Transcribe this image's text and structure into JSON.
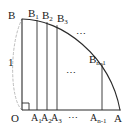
{
  "figure": {
    "kind": "quarter-circle-riemann-sum-diagram",
    "stroke_color": "#2b2b2b",
    "light_stroke_color": "#b9b9b9",
    "background_color": "#ffffff",
    "radius_label": "1",
    "axes": {
      "origin_label": "O",
      "x_end_label": "A",
      "y_end_label": "B"
    },
    "right_angle_marker": true,
    "arc": {
      "from_label": "B",
      "to_label": "A",
      "radius_value": 1
    },
    "dashed_arc": {
      "from_label": "O",
      "to_label": "B",
      "style": "dashed"
    },
    "top_labels": [
      {
        "base": "B",
        "sub": ""
      },
      {
        "base": "B",
        "sub": "1"
      },
      {
        "base": "B",
        "sub": "2"
      },
      {
        "base": "B",
        "sub": "3"
      }
    ],
    "right_label": {
      "base": "B",
      "sub": "n-1"
    },
    "bottom_labels": [
      {
        "base": "O",
        "sub": ""
      },
      {
        "base": "A",
        "sub": "1"
      },
      {
        "base": "A",
        "sub": "2"
      },
      {
        "base": "A",
        "sub": "3"
      },
      {
        "base": "A",
        "sub": "n-1"
      },
      {
        "base": "A",
        "sub": ""
      }
    ],
    "ellipsis_marks": [
      {
        "id": "arc-ellipsis",
        "text": "⋯"
      },
      {
        "id": "interior-ellipsis",
        "text": "⋯"
      },
      {
        "id": "axis-ellipsis",
        "text": "⋯"
      }
    ],
    "vertical_chords": [
      {
        "bottom_label": "A1",
        "top_label": "B1"
      },
      {
        "bottom_label": "A2",
        "top_label": "B2"
      },
      {
        "bottom_label": "A3",
        "top_label": "B3"
      },
      {
        "bottom_label": "An-1",
        "top_label": "Bn-1"
      }
    ]
  }
}
